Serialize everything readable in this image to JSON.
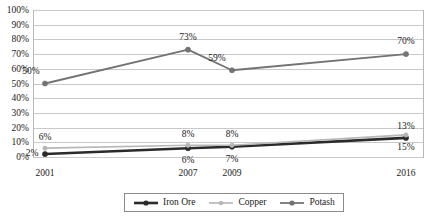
{
  "chart_data": {
    "type": "line",
    "title": "",
    "subtitle": "",
    "xlabel": "",
    "ylabel": "",
    "categories": [
      "2001",
      "2007",
      "2009",
      "2016"
    ],
    "x": [
      2001,
      2007,
      2009,
      2016
    ],
    "ylim": [
      0,
      100
    ],
    "yticks": [
      0,
      10,
      20,
      30,
      40,
      50,
      60,
      70,
      80,
      90,
      100
    ],
    "ytick_labels": [
      "0%",
      "10%",
      "20%",
      "30%",
      "40%",
      "50%",
      "60%",
      "70%",
      "80%",
      "90%",
      "100%"
    ],
    "xtick_labels": [
      "2001",
      "2007",
      "2009",
      "2016"
    ],
    "grid": true,
    "grid_axis": "y",
    "legend_position": "bottom-center",
    "series": [
      {
        "name": "Iron Ore",
        "color": "#2b2b2b",
        "values": [
          2,
          6,
          7,
          13
        ],
        "labels": [
          "2%",
          "6%",
          "7%",
          "13%"
        ],
        "label_positions": [
          "left",
          "below",
          "below",
          "above"
        ]
      },
      {
        "name": "Copper",
        "color": "#b7b7b7",
        "values": [
          6,
          8,
          8,
          15
        ],
        "labels": [
          "6%",
          "8%",
          "8%",
          "15%"
        ],
        "label_positions": [
          "above",
          "above",
          "above",
          "below"
        ]
      },
      {
        "name": "Potash",
        "color": "#737373",
        "values": [
          50,
          73,
          59,
          70
        ],
        "labels": [
          "50%",
          "73%",
          "59%",
          "70%"
        ],
        "label_positions": [
          "left-above",
          "above",
          "left-above",
          "above"
        ]
      }
    ]
  },
  "legend": {
    "items": [
      {
        "label": "Iron Ore",
        "color": "#2b2b2b"
      },
      {
        "label": "Copper",
        "color": "#b7b7b7"
      },
      {
        "label": "Potash",
        "color": "#737373"
      }
    ]
  },
  "axes": {
    "y": {
      "labels": [
        "100%",
        "90%",
        "80%",
        "70%",
        "60%",
        "50%",
        "40%",
        "30%",
        "20%",
        "10%",
        "0%"
      ]
    },
    "x": {
      "labels": [
        "2001",
        "2007",
        "2009",
        "2016"
      ]
    }
  },
  "colors": {
    "iron_ore": "#2b2b2b",
    "copper": "#b7b7b7",
    "potash": "#737373",
    "grid": "#c9c9c9",
    "frame": "#b9b9b9",
    "text": "#1a1a1a",
    "background": "#ffffff"
  }
}
